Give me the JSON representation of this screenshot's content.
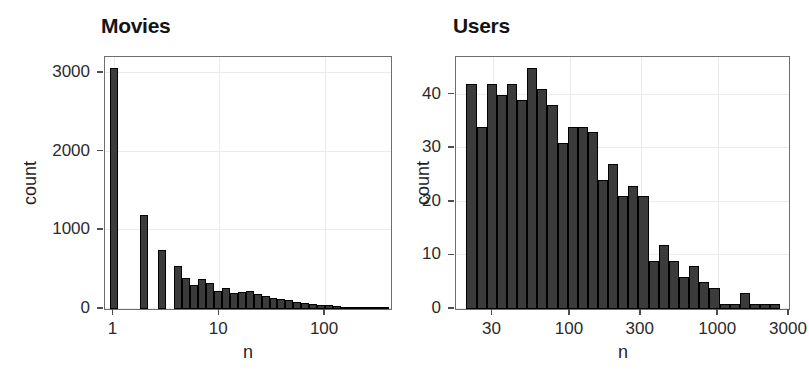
{
  "figure": {
    "background": "#ffffff",
    "bar_fill": "#3b3b3b",
    "bar_stroke": "#000000",
    "grid_color": "#ebebeb",
    "panel_border": "#6e6e6e"
  },
  "panels": {
    "movies": {
      "title": "Movies",
      "xlabel": "n",
      "ylabel": "count",
      "y_ticks": [
        "0",
        "1000",
        "2000",
        "3000"
      ],
      "x_ticks": [
        "1",
        "10",
        "100"
      ]
    },
    "users": {
      "title": "Users",
      "xlabel": "n",
      "ylabel": "count",
      "y_ticks": [
        "0",
        "10",
        "20",
        "30",
        "40"
      ],
      "x_ticks": [
        "30",
        "100",
        "300",
        "1000",
        "3000"
      ]
    }
  },
  "chart_data": [
    {
      "type": "bar",
      "title": "Movies",
      "xlabel": "n",
      "ylabel": "count",
      "xscale": "log10",
      "xlim": [
        0.83,
        420
      ],
      "ylim": [
        0,
        3200
      ],
      "y_ticks": [
        0,
        1000,
        2000,
        3000
      ],
      "x_ticks": [
        1,
        10,
        100
      ],
      "grid": true,
      "note": "histogram of ratings-per-movie on a log10 x axis",
      "bins": [
        {
          "x_left": 0.92,
          "x_right": 1.09,
          "value": 3060
        },
        {
          "x_left": 1.09,
          "x_right": 1.78,
          "value": 0
        },
        {
          "x_left": 1.78,
          "x_right": 2.12,
          "value": 1200
        },
        {
          "x_left": 2.12,
          "x_right": 2.65,
          "value": 0
        },
        {
          "x_left": 2.65,
          "x_right": 3.16,
          "value": 750
        },
        {
          "x_left": 3.16,
          "x_right": 3.76,
          "value": 0
        },
        {
          "x_left": 3.76,
          "x_right": 4.47,
          "value": 545
        },
        {
          "x_left": 4.47,
          "x_right": 5.31,
          "value": 390
        },
        {
          "x_left": 5.31,
          "x_right": 6.31,
          "value": 300
        },
        {
          "x_left": 6.31,
          "x_right": 7.5,
          "value": 385
        },
        {
          "x_left": 7.5,
          "x_right": 8.91,
          "value": 325
        },
        {
          "x_left": 8.91,
          "x_right": 10.59,
          "value": 225
        },
        {
          "x_left": 10.59,
          "x_right": 12.59,
          "value": 265
        },
        {
          "x_left": 12.59,
          "x_right": 14.96,
          "value": 205
        },
        {
          "x_left": 14.96,
          "x_right": 17.78,
          "value": 215
        },
        {
          "x_left": 17.78,
          "x_right": 21.13,
          "value": 225
        },
        {
          "x_left": 21.13,
          "x_right": 25.12,
          "value": 190
        },
        {
          "x_left": 25.12,
          "x_right": 29.85,
          "value": 160
        },
        {
          "x_left": 29.85,
          "x_right": 35.48,
          "value": 140
        },
        {
          "x_left": 35.48,
          "x_right": 42.17,
          "value": 125
        },
        {
          "x_left": 42.17,
          "x_right": 50.12,
          "value": 110
        },
        {
          "x_left": 50.12,
          "x_right": 59.57,
          "value": 95
        },
        {
          "x_left": 59.57,
          "x_right": 70.79,
          "value": 80
        },
        {
          "x_left": 70.79,
          "x_right": 84.14,
          "value": 70
        },
        {
          "x_left": 84.14,
          "x_right": 100.0,
          "value": 55
        },
        {
          "x_left": 100.0,
          "x_right": 118.85,
          "value": 45
        },
        {
          "x_left": 118.85,
          "x_right": 141.25,
          "value": 35
        },
        {
          "x_left": 141.25,
          "x_right": 167.88,
          "value": 28
        },
        {
          "x_left": 167.88,
          "x_right": 199.53,
          "value": 22
        },
        {
          "x_left": 199.53,
          "x_right": 237.14,
          "value": 16
        },
        {
          "x_left": 237.14,
          "x_right": 281.84,
          "value": 12
        },
        {
          "x_left": 281.84,
          "x_right": 334.97,
          "value": 9
        },
        {
          "x_left": 334.97,
          "x_right": 398.11,
          "value": 6
        }
      ]
    },
    {
      "type": "bar",
      "title": "Users",
      "xlabel": "n",
      "ylabel": "count",
      "xscale": "log10",
      "xlim": [
        17,
        3000
      ],
      "ylim": [
        0,
        47
      ],
      "y_ticks": [
        0,
        10,
        20,
        30,
        40
      ],
      "x_ticks": [
        30,
        100,
        300,
        1000,
        3000
      ],
      "grid": true,
      "note": "histogram of ratings-per-user on a log10 x axis",
      "bins": [
        {
          "x_left": 20.0,
          "x_right": 23.4,
          "value": 42
        },
        {
          "x_left": 23.4,
          "x_right": 27.4,
          "value": 34
        },
        {
          "x_left": 27.4,
          "x_right": 32.0,
          "value": 42
        },
        {
          "x_left": 32.0,
          "x_right": 37.5,
          "value": 40
        },
        {
          "x_left": 37.5,
          "x_right": 43.9,
          "value": 42
        },
        {
          "x_left": 43.9,
          "x_right": 51.3,
          "value": 39
        },
        {
          "x_left": 51.3,
          "x_right": 60.1,
          "value": 45
        },
        {
          "x_left": 60.1,
          "x_right": 70.3,
          "value": 41
        },
        {
          "x_left": 70.3,
          "x_right": 82.3,
          "value": 38
        },
        {
          "x_left": 82.3,
          "x_right": 96.3,
          "value": 31
        },
        {
          "x_left": 96.3,
          "x_right": 112.7,
          "value": 34
        },
        {
          "x_left": 112.7,
          "x_right": 131.9,
          "value": 34
        },
        {
          "x_left": 131.9,
          "x_right": 154.3,
          "value": 33
        },
        {
          "x_left": 154.3,
          "x_right": 180.6,
          "value": 24
        },
        {
          "x_left": 180.6,
          "x_right": 211.4,
          "value": 27
        },
        {
          "x_left": 211.4,
          "x_right": 247.4,
          "value": 21
        },
        {
          "x_left": 247.4,
          "x_right": 289.5,
          "value": 23
        },
        {
          "x_left": 289.5,
          "x_right": 338.8,
          "value": 21
        },
        {
          "x_left": 338.8,
          "x_right": 396.5,
          "value": 9
        },
        {
          "x_left": 396.5,
          "x_right": 464.1,
          "value": 12
        },
        {
          "x_left": 464.1,
          "x_right": 543.1,
          "value": 9
        },
        {
          "x_left": 543.1,
          "x_right": 635.7,
          "value": 6
        },
        {
          "x_left": 635.7,
          "x_right": 744.0,
          "value": 8
        },
        {
          "x_left": 744.0,
          "x_right": 870.8,
          "value": 5
        },
        {
          "x_left": 870.8,
          "x_right": 1019.2,
          "value": 4
        },
        {
          "x_left": 1019.2,
          "x_right": 1192.9,
          "value": 1
        },
        {
          "x_left": 1192.9,
          "x_right": 1396.1,
          "value": 1
        },
        {
          "x_left": 1396.1,
          "x_right": 1634.0,
          "value": 3
        },
        {
          "x_left": 1634.0,
          "x_right": 1912.4,
          "value": 1
        },
        {
          "x_left": 1912.4,
          "x_right": 2238.3,
          "value": 1
        },
        {
          "x_left": 2238.3,
          "x_right": 2619.6,
          "value": 1
        }
      ]
    }
  ]
}
